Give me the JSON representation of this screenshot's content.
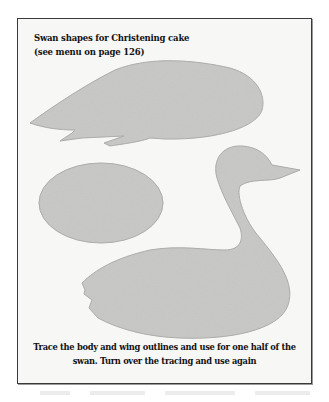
{
  "page": {
    "title_lines": [
      "Swan shapes for Christening cake",
      "(see menu on page 126)"
    ],
    "caption_lines": [
      "Trace the body and wing outlines and use for one half of the",
      "swan. Turn over the tracing and use again"
    ]
  },
  "illustration": {
    "shapes": [
      {
        "id": "wing",
        "label": "Swan wing outline"
      },
      {
        "id": "base",
        "label": "Oval base outline"
      },
      {
        "id": "body",
        "label": "Swan body and neck outline"
      }
    ],
    "fill_color": "#c9c9c7",
    "edge_color": "#a9a9a7"
  }
}
